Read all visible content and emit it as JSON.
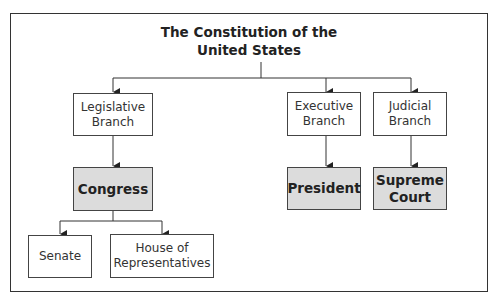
{
  "diagram": {
    "title": "The Constitution of the United States",
    "title_lines": [
      "The Constitution of the",
      "United States"
    ],
    "branches": [
      {
        "label_lines": [
          "Legislative",
          "Branch"
        ],
        "body": {
          "label_lines": [
            "Congress"
          ]
        },
        "sub": [
          {
            "label_lines": [
              "Senate"
            ]
          },
          {
            "label_lines": [
              "House of",
              "Representatives"
            ]
          }
        ]
      },
      {
        "label_lines": [
          "Executive",
          "Branch"
        ],
        "body": {
          "label_lines": [
            "President"
          ]
        }
      },
      {
        "label_lines": [
          "Judicial",
          "Branch"
        ],
        "body": {
          "label_lines": [
            "Supreme",
            "Court"
          ]
        }
      }
    ],
    "colors": {
      "border": "#444444",
      "shaded_fill": "#dcdcdc",
      "line": "#333333"
    }
  }
}
